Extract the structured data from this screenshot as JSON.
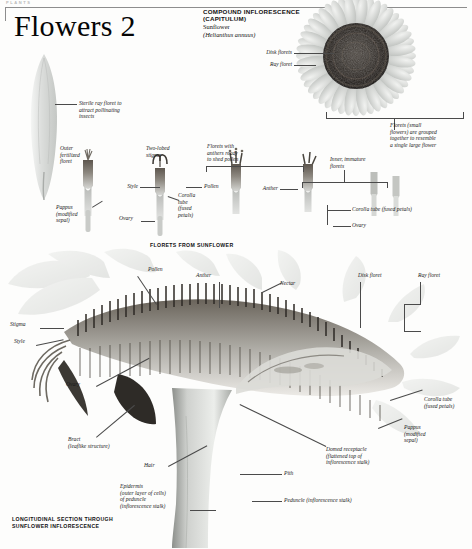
{
  "page": {
    "running_head": "PLANTS",
    "title": "Flowers 2",
    "background_color": "#fdfdfc",
    "ink_color": "#1a1a1a"
  },
  "heading": {
    "line1": "COMPOUND INFLORESCENCE",
    "line2": "(CAPITULUM)",
    "common_name": "Sunflower",
    "latin_name": "(Helianthus annuus)"
  },
  "section_captions": {
    "florets_row": "FLORETS FROM SUNFLOWER",
    "longitudinal": "LONGITUDINAL SECTION THROUGH\nSUNFLOWER INFLORESCENCE"
  },
  "flower_head_labels": {
    "disk_florets": "Disk florets",
    "ray_floret": "Ray floret",
    "bracket_note": "Florets (small\nflowers) are grouped\ntogether to resemble\na single large flower"
  },
  "ray_floret_labels": {
    "sterile": "Sterile ray floret to\nattract pollinating\ninsects"
  },
  "floret_row_labels": {
    "outer_fertilized": "Outer\nfertilized\nfloret",
    "two_lobed_stigma": "Two-lobed\nstigma",
    "style": "Style",
    "pollen": "Pollen",
    "anthers_ready": "Florets with\nanthers ready\nto shed pollen",
    "anther": "Anther",
    "inner_immature": "Inner, immature\nflorets",
    "pappus": "Pappus\n(modified\nsepal)",
    "ovary_left": "Ovary",
    "corolla_tube_mid": "Corolla\ntube\n(fused\npetals)",
    "corolla_tube_right": "Corolla tube (fused petals)",
    "ovary_right": "Ovary"
  },
  "section_labels": {
    "pollen": "Pollen",
    "anther": "Anther",
    "nectar": "Nectar",
    "disk_floret": "Disk floret",
    "ray_floret": "Ray floret",
    "stigma": "Stigma",
    "style": "Style",
    "ovary": "Ovary",
    "bract": "Bract\n(leaflike structure)",
    "hair": "Hair",
    "epidermis": "Epidermis\n(outer layer of cells)\nof peduncle\n(inflorescence stalk)",
    "corolla_tube": "Corolla tube\n(fused petals)",
    "pappus": "Pappus\n(modified\nsepal)",
    "domed_receptacle": "Domed receptacle\n(flattened top of\ninflorescence stalk)",
    "pith": "Pith",
    "peduncle": "Peduncle (inflorescence stalk)"
  },
  "palette": {
    "petal_light": "#dfe1e0",
    "petal_mid": "#c3c6c4",
    "disk_dark": "#2b2b2b",
    "stalk_grey": "#9b9e9b",
    "leader": "#4a4a4a"
  }
}
